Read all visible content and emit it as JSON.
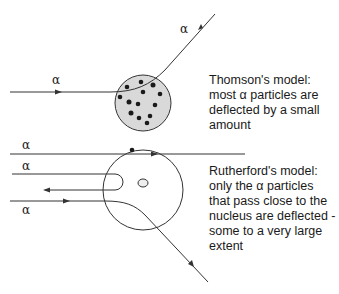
{
  "thomson": {
    "alpha_labels": [
      "α",
      "α"
    ],
    "caption_lines": [
      "Thomson's model:",
      "most α particles are",
      "deflected by a small",
      "amount"
    ]
  },
  "rutherford": {
    "alpha_labels": [
      "α",
      "α",
      "α"
    ],
    "caption_lines": [
      "Rutherford's model:",
      "only the α particles",
      "that pass close to the",
      "nucleus are deflected -",
      "some to a very large",
      "extent"
    ]
  },
  "colors": {
    "line": "#333333",
    "atom_fill": "#d9d9d9",
    "dot": "#1a1a1a"
  }
}
